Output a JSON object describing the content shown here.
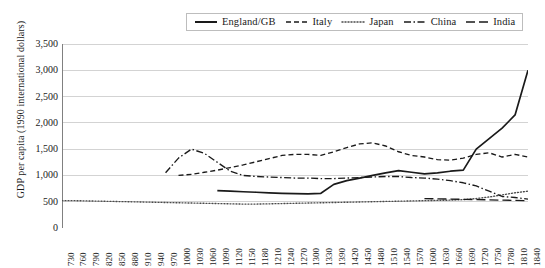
{
  "chart_data": {
    "type": "line",
    "title": "",
    "xlabel": "",
    "ylabel": "GDP per capita (1990 international dollars)",
    "ylim": [
      0,
      3500
    ],
    "ytick_values": [
      0,
      500,
      1000,
      1500,
      2000,
      2500,
      3000,
      3500
    ],
    "ytick_labels": [
      "0",
      "500",
      "1,000",
      "1,500",
      "2,000",
      "2,500",
      "3,000",
      "3,500"
    ],
    "grid": true,
    "legend_position": "top-center",
    "xlim": [
      730,
      1840
    ],
    "xtick_labels": [
      "730",
      "760",
      "790",
      "820",
      "850",
      "880",
      "910",
      "940",
      "970",
      "1000",
      "1030",
      "1060",
      "1090",
      "1120",
      "1150",
      "1180",
      "1210",
      "1240",
      "1270",
      "1300",
      "1330",
      "1390",
      "1420",
      "1450",
      "1480",
      "1510",
      "1540",
      "1570",
      "1600",
      "1630",
      "1660",
      "1690",
      "1720",
      "1750",
      "1780",
      "1810",
      "1840"
    ],
    "series": [
      {
        "name": "England/GB",
        "style": "solid",
        "color": "#1a1a1a",
        "points": [
          [
            1090,
            710
          ],
          [
            1120,
            700
          ],
          [
            1150,
            690
          ],
          [
            1180,
            680
          ],
          [
            1210,
            670
          ],
          [
            1240,
            660
          ],
          [
            1270,
            655
          ],
          [
            1300,
            650
          ],
          [
            1330,
            660
          ],
          [
            1390,
            830
          ],
          [
            1420,
            900
          ],
          [
            1450,
            950
          ],
          [
            1480,
            1000
          ],
          [
            1510,
            1050
          ],
          [
            1540,
            1090
          ],
          [
            1570,
            1060
          ],
          [
            1600,
            1030
          ],
          [
            1630,
            1050
          ],
          [
            1660,
            1080
          ],
          [
            1690,
            1100
          ],
          [
            1720,
            1500
          ],
          [
            1750,
            1700
          ],
          [
            1780,
            1900
          ],
          [
            1810,
            2150
          ],
          [
            1840,
            3000
          ]
        ]
      },
      {
        "name": "Italy",
        "style": "dashed",
        "color": "#1a1a1a",
        "points": [
          [
            1000,
            1000
          ],
          [
            1030,
            1020
          ],
          [
            1060,
            1060
          ],
          [
            1090,
            1100
          ],
          [
            1120,
            1150
          ],
          [
            1150,
            1200
          ],
          [
            1180,
            1260
          ],
          [
            1210,
            1320
          ],
          [
            1240,
            1380
          ],
          [
            1270,
            1400
          ],
          [
            1300,
            1400
          ],
          [
            1330,
            1380
          ],
          [
            1390,
            1450
          ],
          [
            1420,
            1530
          ],
          [
            1450,
            1600
          ],
          [
            1480,
            1620
          ],
          [
            1510,
            1560
          ],
          [
            1540,
            1450
          ],
          [
            1570,
            1380
          ],
          [
            1600,
            1350
          ],
          [
            1630,
            1300
          ],
          [
            1660,
            1290
          ],
          [
            1690,
            1330
          ],
          [
            1720,
            1400
          ],
          [
            1750,
            1430
          ],
          [
            1780,
            1350
          ],
          [
            1810,
            1400
          ],
          [
            1840,
            1350
          ]
        ]
      },
      {
        "name": "Japan",
        "style": "dotted",
        "color": "#4a4a4a",
        "points": [
          [
            730,
            520
          ],
          [
            760,
            520
          ],
          [
            790,
            515
          ],
          [
            820,
            510
          ],
          [
            850,
            505
          ],
          [
            880,
            500
          ],
          [
            910,
            495
          ],
          [
            940,
            490
          ],
          [
            970,
            485
          ],
          [
            1000,
            480
          ],
          [
            1030,
            475
          ],
          [
            1060,
            470
          ],
          [
            1090,
            465
          ],
          [
            1120,
            460
          ],
          [
            1150,
            455
          ],
          [
            1180,
            455
          ],
          [
            1210,
            460
          ],
          [
            1240,
            465
          ],
          [
            1270,
            470
          ],
          [
            1300,
            475
          ],
          [
            1330,
            480
          ],
          [
            1390,
            485
          ],
          [
            1420,
            490
          ],
          [
            1450,
            495
          ],
          [
            1480,
            500
          ],
          [
            1510,
            505
          ],
          [
            1540,
            510
          ],
          [
            1570,
            515
          ],
          [
            1600,
            520
          ],
          [
            1630,
            525
          ],
          [
            1660,
            530
          ],
          [
            1690,
            540
          ],
          [
            1720,
            560
          ],
          [
            1750,
            590
          ],
          [
            1780,
            630
          ],
          [
            1810,
            670
          ],
          [
            1840,
            700
          ]
        ]
      },
      {
        "name": "China",
        "style": "dashdot",
        "color": "#1a1a1a",
        "points": [
          [
            970,
            1050
          ],
          [
            1000,
            1330
          ],
          [
            1030,
            1500
          ],
          [
            1060,
            1420
          ],
          [
            1090,
            1250
          ],
          [
            1120,
            1080
          ],
          [
            1150,
            1000
          ],
          [
            1180,
            980
          ],
          [
            1210,
            970
          ],
          [
            1240,
            960
          ],
          [
            1270,
            950
          ],
          [
            1300,
            950
          ],
          [
            1330,
            940
          ],
          [
            1390,
            940
          ],
          [
            1420,
            950
          ],
          [
            1450,
            960
          ],
          [
            1480,
            970
          ],
          [
            1510,
            980
          ],
          [
            1540,
            980
          ],
          [
            1570,
            960
          ],
          [
            1600,
            950
          ],
          [
            1630,
            930
          ],
          [
            1660,
            900
          ],
          [
            1690,
            860
          ],
          [
            1720,
            800
          ],
          [
            1750,
            700
          ],
          [
            1780,
            600
          ],
          [
            1810,
            580
          ],
          [
            1840,
            550
          ]
        ]
      },
      {
        "name": "India",
        "style": "longdash",
        "color": "#1a1a1a",
        "points": [
          [
            1600,
            560
          ],
          [
            1630,
            555
          ],
          [
            1660,
            550
          ],
          [
            1690,
            545
          ],
          [
            1720,
            540
          ],
          [
            1750,
            535
          ],
          [
            1780,
            530
          ],
          [
            1810,
            525
          ],
          [
            1840,
            520
          ]
        ]
      }
    ]
  },
  "legend": {
    "items": [
      {
        "label": "England/GB"
      },
      {
        "label": "Italy"
      },
      {
        "label": "Japan"
      },
      {
        "label": "China"
      },
      {
        "label": "India"
      }
    ]
  }
}
